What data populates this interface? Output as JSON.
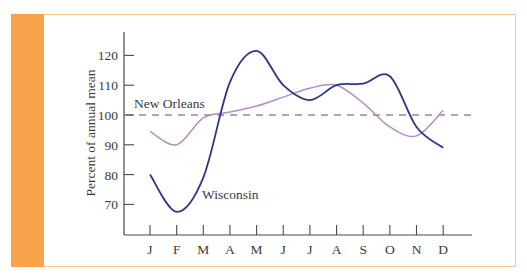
{
  "chart_data": {
    "type": "line",
    "title": "",
    "xlabel": "",
    "ylabel": "Percent of annual mean",
    "categories": [
      "J",
      "F",
      "M",
      "A",
      "M",
      "J",
      "J",
      "A",
      "S",
      "O",
      "N",
      "D"
    ],
    "y_ticks": [
      70,
      80,
      90,
      100,
      110,
      120
    ],
    "ylim": [
      61,
      128
    ],
    "grid": false,
    "reference_line": {
      "value": 100,
      "style": "dashed",
      "label": "New Orleans"
    },
    "series": [
      {
        "name": "Wisconsin",
        "color": "#2e3584",
        "values": [
          80,
          67.5,
          79,
          111,
          121.5,
          110,
          105,
          110,
          110.5,
          113,
          96,
          89
        ]
      },
      {
        "name": "New Orleans",
        "color": "#b48cc2",
        "values": [
          94.5,
          90,
          99,
          101,
          103,
          106,
          109,
          110,
          104,
          96,
          93,
          101.5
        ]
      }
    ],
    "annotations": [
      {
        "text": "New Orleans",
        "near": "dashed 100 line, left"
      },
      {
        "text": "Wisconsin",
        "near": "Wisconsin curve, lower left"
      }
    ]
  },
  "frame": {
    "accent_color": "#f9a24c",
    "border_color": "#f6cb8f"
  },
  "labels": {
    "ylabel": "Percent of annual mean",
    "new_orleans": "New Orleans",
    "wisconsin": "Wisconsin"
  }
}
